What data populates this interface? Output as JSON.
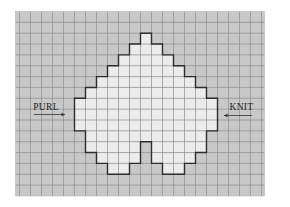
{
  "diagram": {
    "type": "knitting-chart",
    "colors": {
      "page_background": "#ffffff",
      "background_stitch": "#c8c8c8",
      "motif_stitch": "#ececec",
      "grid_line": "#8e8e8e",
      "outline": "#2e2e2e",
      "text": "#222222"
    },
    "grid": {
      "left": 15.5,
      "top": 11.5,
      "right": 264.5,
      "bottom": 196,
      "first_col_x": 19.5,
      "cell_w": 11,
      "cell_h": 10.85,
      "cols": 22,
      "rows": 17
    },
    "motif_rows": [
      {
        "row": 2,
        "spans": [
          [
            11,
            11
          ]
        ]
      },
      {
        "row": 3,
        "spans": [
          [
            10,
            12
          ]
        ]
      },
      {
        "row": 4,
        "spans": [
          [
            9,
            13
          ]
        ]
      },
      {
        "row": 5,
        "spans": [
          [
            8,
            14
          ]
        ]
      },
      {
        "row": 6,
        "spans": [
          [
            7,
            15
          ]
        ]
      },
      {
        "row": 7,
        "spans": [
          [
            6,
            16
          ]
        ]
      },
      {
        "row": 8,
        "spans": [
          [
            5,
            17
          ]
        ]
      },
      {
        "row": 9,
        "spans": [
          [
            5,
            17
          ]
        ]
      },
      {
        "row": 10,
        "spans": [
          [
            5,
            17
          ]
        ]
      },
      {
        "row": 11,
        "spans": [
          [
            6,
            16
          ]
        ]
      },
      {
        "row": 12,
        "spans": [
          [
            6,
            10
          ],
          [
            12,
            16
          ]
        ]
      },
      {
        "row": 13,
        "spans": [
          [
            7,
            10
          ],
          [
            12,
            15
          ]
        ]
      },
      {
        "row": 14,
        "spans": [
          [
            8,
            9
          ],
          [
            13,
            14
          ]
        ]
      }
    ],
    "labels": {
      "left": {
        "text": "PURL",
        "direction": "right",
        "x": 46,
        "y": 109.5,
        "arrow_y": 114.5,
        "arrow_from": 34,
        "arrow_to": 65
      },
      "right": {
        "text": "KNIT",
        "direction": "left",
        "x": 241.5,
        "y": 109.5,
        "arrow_y": 115.5,
        "arrow_from": 252,
        "arrow_to": 224
      }
    }
  }
}
